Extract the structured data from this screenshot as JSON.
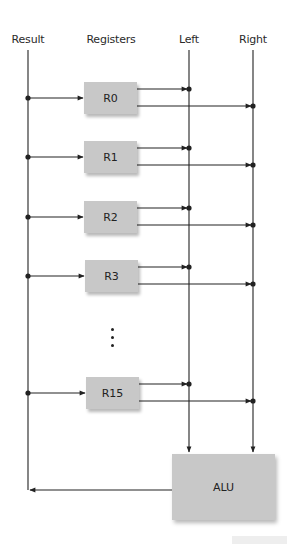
{
  "labels": {
    "result": "Result",
    "registers": "Registers",
    "left": "Left",
    "right": "Right"
  },
  "registers": [
    {
      "name": "R0",
      "y": 82
    },
    {
      "name": "R1",
      "y": 141
    },
    {
      "name": "R2",
      "y": 201
    },
    {
      "name": "R3",
      "y": 260
    },
    {
      "name": "R15",
      "y": 377
    }
  ],
  "alu": {
    "label": "ALU"
  },
  "colors": {
    "box_fill": "#c8c8c8",
    "line": "#222222"
  }
}
